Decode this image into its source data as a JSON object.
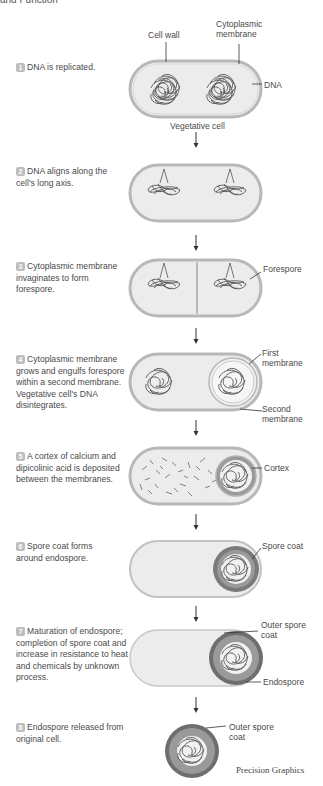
{
  "header": {
    "title": "and Function"
  },
  "steps": [
    {
      "num": "1",
      "text": "DNA is replicated."
    },
    {
      "num": "2",
      "text": "DNA aligns along the cell's long axis."
    },
    {
      "num": "3",
      "text": "Cytoplasmic membrane invaginates to form forespore."
    },
    {
      "num": "4",
      "text": "Cytoplasmic membrane grows and engulfs forespore within a second membrane. Vegetative cell's DNA disintegrates."
    },
    {
      "num": "5",
      "text": "A cortex of calcium and dipicolinic acid is deposited between the membranes."
    },
    {
      "num": "6",
      "text": "Spore coat forms around endospore."
    },
    {
      "num": "7",
      "text": "Maturation of endospore; completion of spore coat and increase in resistance to heat and chemicals by unknown process."
    },
    {
      "num": "8",
      "text": "Endospore released from original cell."
    }
  ],
  "labels": {
    "cell_wall": "Cell wall",
    "cytoplasmic_membrane": "Cytoplasmic membrane",
    "dna": "DNA",
    "vegetative_cell": "Vegetative cell",
    "forespore": "Forespore",
    "first_membrane": "First membrane",
    "second_membrane": "Second membrane",
    "cortex": "Cortex",
    "spore_coat": "Spore coat",
    "outer_spore_coat_7": "Outer spore coat",
    "endospore": "Endospore",
    "outer_spore_coat_8": "Outer spore coat"
  },
  "colors": {
    "cell_fill": "#ececec",
    "cell_outline": "#b8b8b8",
    "dna": "#555555",
    "number_badge": "#bdbdbd",
    "cortex": "#9a9a9a",
    "spore_coat": "#7a7a7a"
  },
  "credit": "Precision Graphics"
}
